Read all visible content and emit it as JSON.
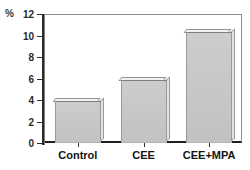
{
  "chart_data": {
    "type": "bar",
    "title": "",
    "xlabel": "",
    "ylabel": "%",
    "categories": [
      "Control",
      "CEE",
      "CEE+MPA"
    ],
    "values": [
      3.9,
      5.9,
      10.3
    ],
    "ylim": [
      0,
      12
    ],
    "yticks": [
      0,
      2,
      4,
      6,
      8,
      10,
      12
    ],
    "ytick_labels": [
      "0",
      "2",
      "4",
      "6",
      "8",
      "10",
      "12"
    ],
    "grid": false,
    "legend": false,
    "series": [
      {
        "name": "percent",
        "values": [
          3.9,
          5.9,
          10.3
        ]
      }
    ],
    "colors": {
      "bar_fill": "#c9c9c9",
      "bar_edge": "#7e7e7e",
      "bar_highlight": "#f2f2f2",
      "axis": "#1f1f1f",
      "text": "#141414",
      "background": "#ffffff"
    }
  },
  "axis": {
    "unit_label": "%"
  }
}
